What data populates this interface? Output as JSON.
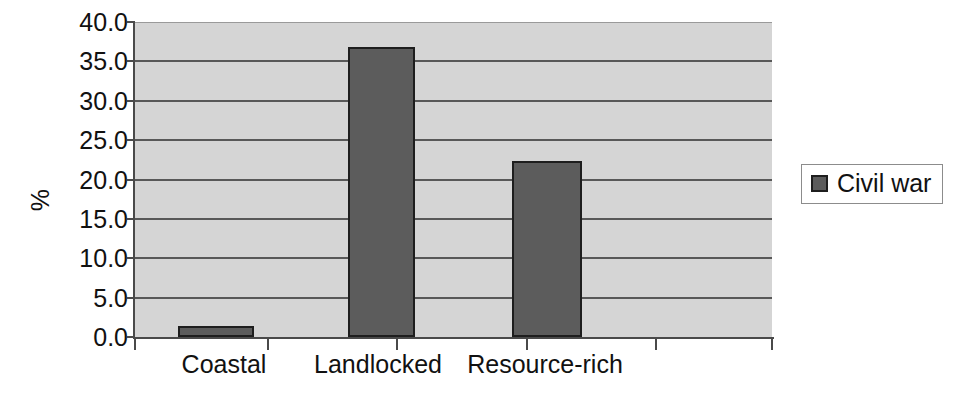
{
  "chart_data": {
    "type": "bar",
    "title": "",
    "subtitle": "",
    "xlabel": "",
    "ylabel": "%",
    "categories": [
      "Coastal",
      "Landlocked",
      "Resource-rich"
    ],
    "series": [
      {
        "name": "Civil war",
        "values": [
          1.4,
          36.8,
          22.3
        ],
        "color": "#5c5c5c"
      }
    ],
    "ylim": [
      0.0,
      40.0
    ],
    "ytick_step": 5.0,
    "ytick_labels": [
      "0.0",
      "5.0",
      "10.0",
      "15.0",
      "20.0",
      "25.0",
      "30.0",
      "35.0",
      "40.0"
    ],
    "ytick_values": [
      0.0,
      5.0,
      10.0,
      15.0,
      20.0,
      25.0,
      30.0,
      35.0,
      40.0
    ],
    "grid": true,
    "grid_axis": "y",
    "legend_position": "right",
    "legend_entries": [
      "Civil war"
    ],
    "plot_background": "#d5d5d5",
    "grid_color": "#585858",
    "axis_color": "#4a4a4a",
    "bar_edge_color": "#1e1e1e"
  }
}
